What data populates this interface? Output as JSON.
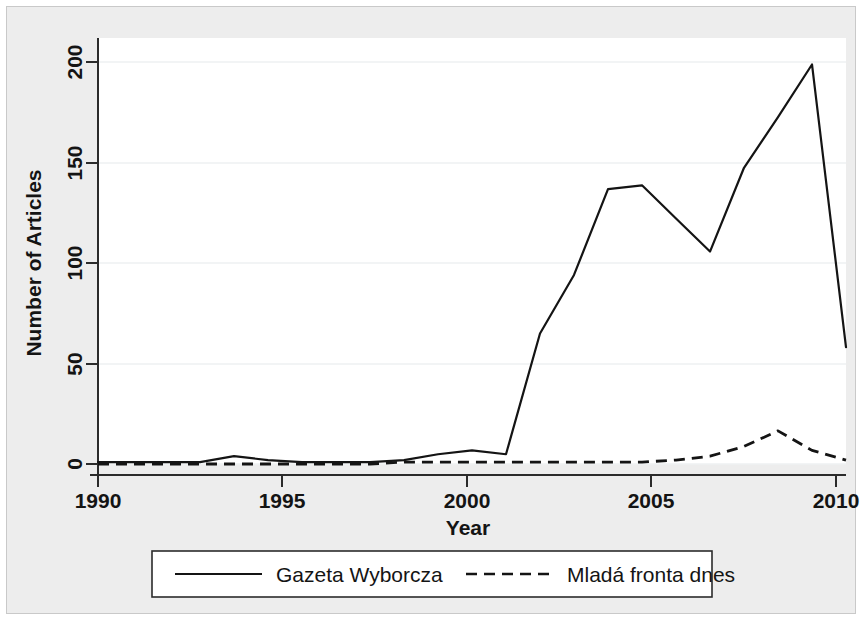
{
  "chart_data": {
    "type": "line",
    "title": "",
    "subtitle": "",
    "xlabel": "Year",
    "ylabel": "Number of Articles",
    "xlim": [
      1990,
      2012
    ],
    "ylim": [
      0,
      215
    ],
    "xticks": [
      1990,
      1995,
      2000,
      2005,
      2010
    ],
    "yticks": [
      0,
      50,
      100,
      150,
      200
    ],
    "xtick_labels": [
      "1990",
      "1995",
      "2000",
      "2005",
      "2010"
    ],
    "ytick_labels": [
      "0",
      "50",
      "100",
      "150",
      "200"
    ],
    "grid": "horizontal",
    "legend_position": "below-plot",
    "x": [
      1990,
      1991,
      1992,
      1993,
      1994,
      1995,
      1996,
      1997,
      1998,
      1999,
      2000,
      2001,
      2002,
      2003,
      2004,
      2005,
      2006,
      2007,
      2008,
      2009,
      2010,
      2011,
      2012
    ],
    "series": [
      {
        "name": "Gazeta Wyborcza",
        "style": "solid",
        "color": "#141414",
        "values": [
          1,
          1,
          1,
          1,
          4,
          2,
          1,
          1,
          1,
          2,
          5,
          7,
          5,
          67,
          97,
          141,
          143,
          126,
          109,
          152,
          178,
          205,
          60
        ]
      },
      {
        "name": "Mladá fronta dnes",
        "style": "dashed",
        "color": "#141414",
        "values": [
          0,
          0,
          0,
          0,
          0,
          0,
          0,
          0,
          0,
          1,
          1,
          1,
          1,
          1,
          1,
          1,
          1,
          2,
          4,
          9,
          17,
          7,
          2
        ]
      }
    ]
  },
  "axes": {
    "x_title": "Year",
    "y_title": "Number of Articles"
  },
  "legend": {
    "entries": [
      {
        "label": "Gazeta Wyborcza",
        "style": "solid"
      },
      {
        "label": "Mladá fronta dnes",
        "style": "dashed"
      }
    ]
  },
  "colors": {
    "background": "#ededed",
    "plot_background": "#ffffff",
    "ink": "#141414",
    "gridline": "#eef0f2",
    "axis": "#3a3a3a"
  }
}
